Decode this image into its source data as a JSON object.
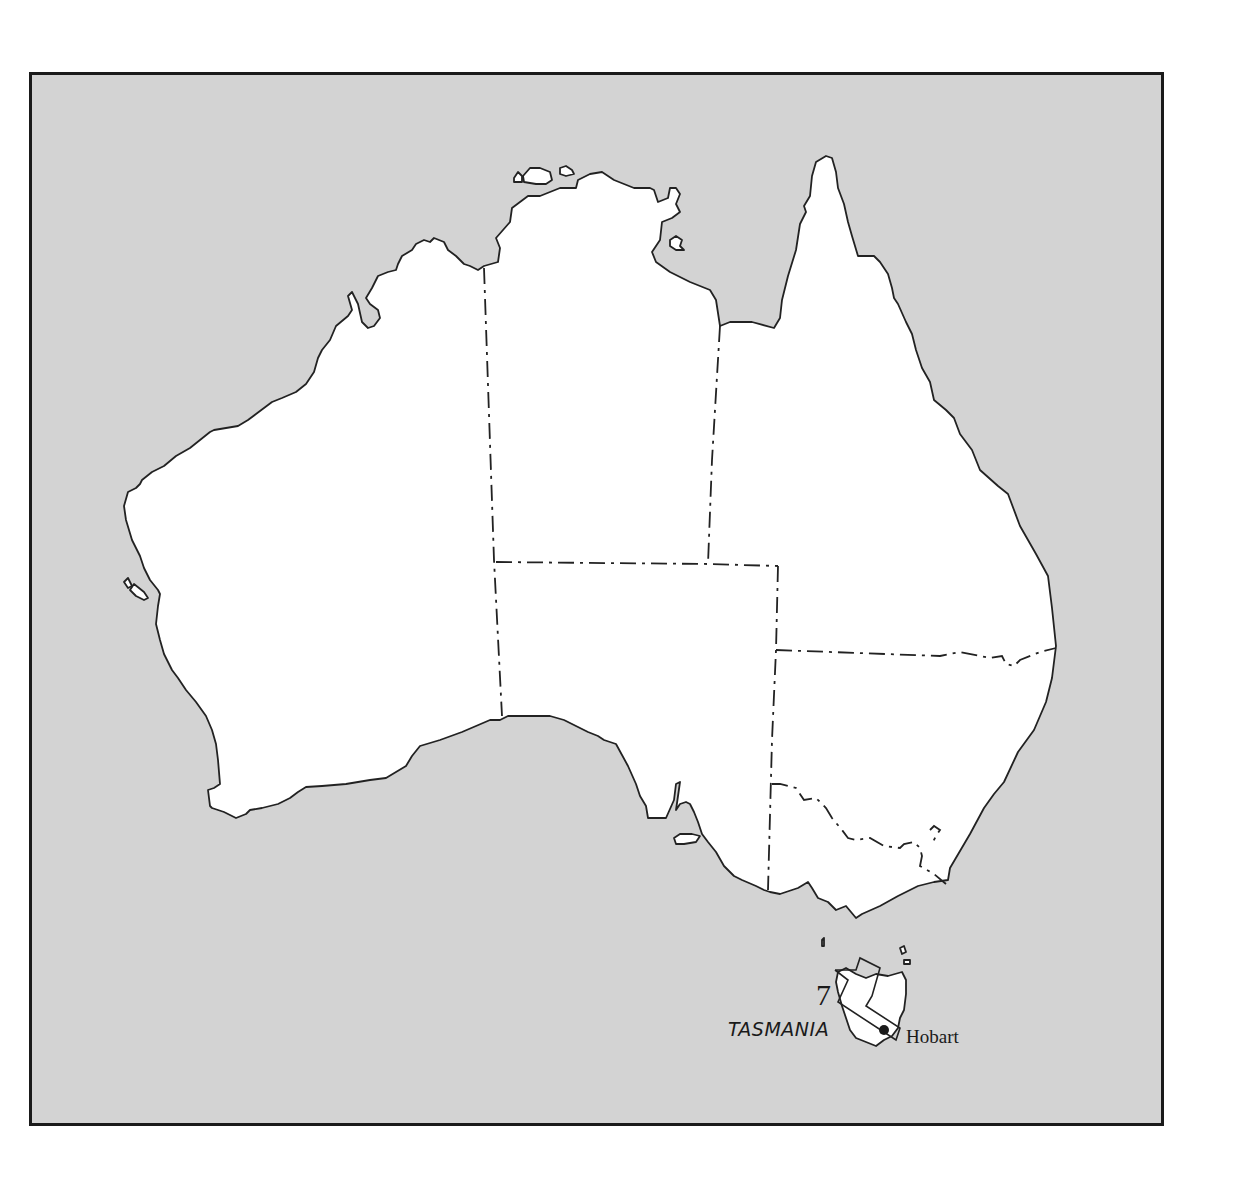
{
  "map": {
    "title": "Australia",
    "region_label": "TASMANIA",
    "city_label": "Hobart",
    "area_number": "7",
    "colors": {
      "sea": "#d3d3d3",
      "land": "#ffffff",
      "outline": "#222222",
      "frame": "#1a1a1a"
    },
    "features": [
      {
        "name": "mainland-australia",
        "type": "landmass"
      },
      {
        "name": "tasmania",
        "type": "landmass"
      },
      {
        "name": "state-borders",
        "type": "dash-dot-lines"
      },
      {
        "name": "hobart",
        "type": "city-dot"
      },
      {
        "name": "area-7-outline",
        "type": "rectangular-outline"
      }
    ]
  }
}
